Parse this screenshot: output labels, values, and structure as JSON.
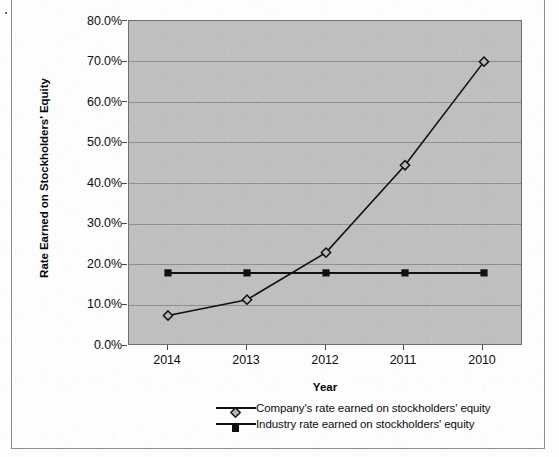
{
  "chart_data": {
    "type": "line",
    "title": "",
    "xlabel": "Year",
    "ylabel": "Rate Earned on Stockholders' Equity",
    "categories": [
      "2014",
      "2013",
      "2012",
      "2011",
      "2010"
    ],
    "ylim": [
      0,
      0.8
    ],
    "y_tick_step": 0.1,
    "y_tick_labels": [
      "0.0%",
      "10.0%",
      "20.0%",
      "30.0%",
      "40.0%",
      "50.0%",
      "60.0%",
      "70.0%",
      "80.0%"
    ],
    "y_tick_values": [
      0,
      0.1,
      0.2,
      0.3,
      0.4,
      0.5,
      0.6,
      0.7,
      0.8
    ],
    "grid": true,
    "legend_position": "bottom",
    "plot_background": "#bfbfbf",
    "series": [
      {
        "name": "Company's rate earned on stockholders' equity",
        "marker": "open-diamond",
        "color": "#111111",
        "values": [
          0.075,
          0.114,
          0.23,
          0.445,
          0.7
        ],
        "value_labels": [
          "7.5%",
          "11.4%",
          "23.0%",
          "44.5%",
          "70.0%"
        ]
      },
      {
        "name": "Industry rate earned on stockholders' equity",
        "marker": "filled-square",
        "color": "#111111",
        "values": [
          0.18,
          0.18,
          0.18,
          0.18,
          0.18
        ],
        "value_labels": [
          "18.0%",
          "18.0%",
          "18.0%",
          "18.0%",
          "18.0%"
        ]
      }
    ]
  },
  "axes": {
    "y_title": "Rate Earned on Stockholders' Equity",
    "x_title": "Year"
  },
  "legend": {
    "entries": [
      {
        "label": "Company's rate earned on stockholders' equity",
        "marker": "open-diamond"
      },
      {
        "label": "Industry rate earned on stockholders' equity",
        "marker": "filled-square"
      }
    ]
  }
}
